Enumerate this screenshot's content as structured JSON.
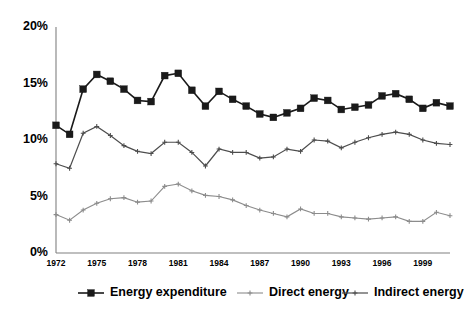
{
  "chart_data": {
    "type": "line",
    "title": "",
    "subtitle": "",
    "xlabel": "",
    "ylabel": "",
    "xlim": [
      1972,
      2001
    ],
    "ylim": [
      0,
      20
    ],
    "grid": false,
    "legend_position": "bottom",
    "y_ticks": [
      "0%",
      "5%",
      "10%",
      "15%",
      "20%"
    ],
    "y_tick_values": [
      0,
      5,
      10,
      15,
      20
    ],
    "x_ticks": [
      "1972",
      "1975",
      "1978",
      "1981",
      "1984",
      "1987",
      "1990",
      "1993",
      "1996",
      "1999"
    ],
    "x_tick_values": [
      1972,
      1975,
      1978,
      1981,
      1984,
      1987,
      1990,
      1993,
      1996,
      1999
    ],
    "x": [
      1972,
      1973,
      1974,
      1975,
      1976,
      1977,
      1978,
      1979,
      1980,
      1981,
      1982,
      1983,
      1984,
      1985,
      1986,
      1987,
      1988,
      1989,
      1990,
      1991,
      1992,
      1993,
      1994,
      1995,
      1996,
      1997,
      1998,
      1999,
      2000,
      2001
    ],
    "series": [
      {
        "name": "Energy expenditure",
        "color": "#1a1a1a",
        "marker": "square",
        "marker_size": 3.4,
        "line_width": 1.6,
        "values": [
          11.3,
          10.5,
          14.5,
          15.8,
          15.2,
          14.5,
          13.5,
          13.4,
          15.7,
          15.9,
          14.4,
          13.0,
          14.3,
          13.6,
          13.0,
          12.3,
          12.0,
          12.4,
          12.8,
          13.7,
          13.5,
          12.7,
          12.9,
          13.1,
          13.9,
          14.1,
          13.6,
          12.8,
          13.3,
          13.0
        ]
      },
      {
        "name": "Direct energy",
        "color": "#8c8c8c",
        "marker": "plus",
        "marker_size": 2.4,
        "line_width": 1.1,
        "values": [
          3.4,
          2.9,
          3.8,
          4.4,
          4.8,
          4.9,
          4.5,
          4.6,
          5.9,
          6.1,
          5.5,
          5.1,
          5.0,
          4.7,
          4.2,
          3.8,
          3.5,
          3.2,
          3.9,
          3.5,
          3.5,
          3.2,
          3.1,
          3.0,
          3.1,
          3.2,
          2.8,
          2.8,
          3.6,
          3.3
        ]
      },
      {
        "name": "Indirect energy",
        "color": "#4d4d4d",
        "marker": "plus",
        "marker_size": 2.4,
        "line_width": 1.2,
        "values": [
          7.9,
          7.5,
          10.6,
          11.2,
          10.4,
          9.5,
          9.0,
          8.8,
          9.8,
          9.8,
          8.9,
          7.7,
          9.2,
          8.9,
          8.9,
          8.4,
          8.5,
          9.2,
          9.0,
          10.0,
          9.9,
          9.3,
          9.8,
          10.2,
          10.5,
          10.7,
          10.5,
          10.0,
          9.7,
          9.6
        ]
      }
    ]
  },
  "legend": {
    "items": [
      {
        "label": "Energy expenditure"
      },
      {
        "label": "Direct energy"
      },
      {
        "label": "Indirect energy"
      }
    ]
  }
}
